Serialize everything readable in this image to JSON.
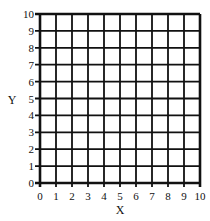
{
  "chart_data": {
    "type": "scatter",
    "title": "",
    "xlabel": "X",
    "ylabel": "Y",
    "xlim": [
      0,
      10
    ],
    "ylim": [
      0,
      10
    ],
    "x_ticks": [
      "0",
      "1",
      "2",
      "3",
      "4",
      "5",
      "6",
      "7",
      "8",
      "9",
      "10"
    ],
    "y_ticks": [
      "0",
      "1",
      "2",
      "3",
      "4",
      "5",
      "6",
      "7",
      "8",
      "9",
      "10"
    ],
    "grid": true,
    "series": [],
    "legend": null
  },
  "colors": {
    "grid_line": "#111111",
    "background": "#ffffff"
  }
}
